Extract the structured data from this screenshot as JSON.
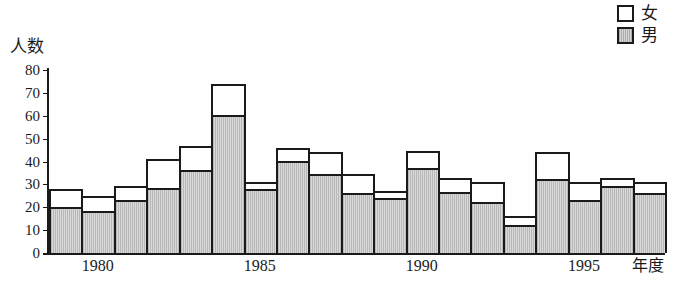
{
  "legend": {
    "items": [
      {
        "label": "女",
        "swatch": "white-square-icon",
        "fill": "#ffffff"
      },
      {
        "label": "男",
        "swatch": "gray-square-icon",
        "fill": "#d9d9d9"
      }
    ]
  },
  "axis": {
    "y_title": "人数",
    "x_title": "年度",
    "y_ticks": [
      "0",
      "10",
      "20",
      "30",
      "40",
      "50",
      "60",
      "70",
      "80"
    ],
    "x_ticks": [
      "1980",
      "1985",
      "1990",
      "1995"
    ]
  },
  "chart_data": {
    "type": "bar",
    "stacked": true,
    "title": "",
    "xlabel": "年度",
    "ylabel": "人数",
    "ylim": [
      0,
      80
    ],
    "grid": false,
    "legend_position": "top-right",
    "categories": [
      "1979",
      "1980",
      "1981",
      "1982",
      "1983",
      "1984",
      "1985",
      "1986",
      "1987",
      "1988",
      "1989",
      "1990",
      "1991",
      "1992",
      "1993",
      "1994",
      "1995",
      "1996",
      "1997"
    ],
    "tick_labels": [
      "",
      "1980",
      "",
      "",
      "",
      "",
      "1985",
      "",
      "",
      "",
      "",
      "1990",
      "",
      "",
      "",
      "",
      "1995",
      "",
      ""
    ],
    "series": [
      {
        "name": "男",
        "color": "#d9d9d9",
        "values": [
          20,
          18,
          23,
          28,
          36,
          60,
          28,
          40,
          34.5,
          26,
          24,
          37,
          26.5,
          22,
          12,
          32,
          23,
          29,
          26
        ]
      },
      {
        "name": "女",
        "color": "#ffffff",
        "values": [
          8,
          7,
          6.5,
          13,
          11,
          14,
          3,
          6,
          9.5,
          8.5,
          3,
          7.5,
          6.5,
          9,
          4,
          12,
          8,
          4,
          5
        ]
      }
    ],
    "totals": [
      28,
      25,
      29.5,
      41,
      47,
      74,
      31,
      46,
      44,
      34.5,
      27,
      44.5,
      33,
      31,
      16,
      44,
      31,
      33,
      31
    ]
  }
}
